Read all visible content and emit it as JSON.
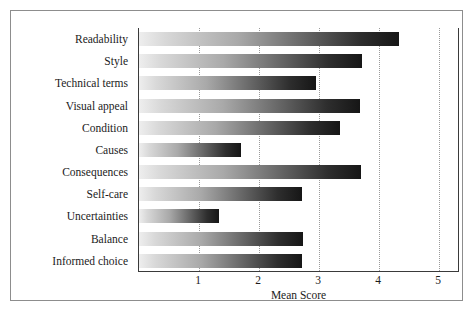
{
  "chart_data": {
    "type": "bar",
    "orientation": "horizontal",
    "title": "",
    "xlabel": "Mean Score",
    "ylabel": "",
    "xlim": [
      0,
      5.35
    ],
    "xticks": [
      1,
      2,
      3,
      4,
      5
    ],
    "xtick_labels": [
      "1",
      "2",
      "3",
      "4",
      "5"
    ],
    "grid": "vertical-dotted",
    "legend": null,
    "categories": [
      "Readability",
      "Style",
      "Technical terms",
      "Visual appeal",
      "Condition",
      "Causes",
      "Consequences",
      "Self-care",
      "Uncertainties",
      "Balance",
      "Informed choice"
    ],
    "values": [
      4.33,
      3.71,
      2.95,
      3.68,
      3.35,
      1.7,
      3.7,
      2.71,
      1.33,
      2.73,
      2.72
    ],
    "bar_fill": "gradient-light-to-dark",
    "bar_gradient_start": "#eeeeee",
    "bar_gradient_end": "#161616",
    "axis_color": "#3a3a3a",
    "gridline_color": "#9a9a9a",
    "frame_color": "#8d8d8d",
    "background": "#ffffff"
  }
}
